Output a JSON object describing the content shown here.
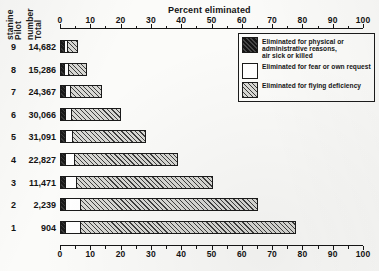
{
  "chart_data": {
    "type": "bar",
    "title": "Percent eliminated",
    "xlabel": "Percent eliminated",
    "ylabel": "Pilot stanine",
    "orientation": "horizontal",
    "stacked": true,
    "xlim": [
      0,
      100
    ],
    "xticks": [
      0,
      10,
      20,
      30,
      40,
      50,
      60,
      70,
      80,
      90,
      100
    ],
    "xtick_labels": [
      "0",
      "10",
      "20",
      "30",
      "40",
      "50",
      "60",
      "70",
      "80",
      "90",
      "100"
    ],
    "minor_tick_step": 5,
    "grid": false,
    "legend_position": "upper right",
    "categories": [
      "9",
      "8",
      "7",
      "6",
      "5",
      "4",
      "3",
      "2",
      "1"
    ],
    "row_extra_labels": [
      "14,682",
      "15,286",
      "24,367",
      "30,066",
      "31,091",
      "22,827",
      "11,471",
      "2,239",
      "904"
    ],
    "series": [
      {
        "name": "Eliminated for physical or administrative reasons, air sick or killed",
        "values": [
          1.5,
          1.6,
          1.7,
          1.6,
          1.6,
          1.6,
          1.6,
          1.7,
          1.7
        ]
      },
      {
        "name": "Eliminated for fear or own request",
        "values": [
          1.1,
          1.4,
          1.6,
          2.0,
          2.4,
          3.0,
          3.8,
          5.0,
          5.0
        ]
      },
      {
        "name": "Eliminated for flying deficiency",
        "values": [
          3.4,
          6.0,
          10.7,
          16.4,
          24.5,
          34.4,
          45.1,
          58.8,
          71.3
        ]
      }
    ],
    "totals_percent": [
      6.0,
      9.0,
      14.0,
      20.0,
      28.5,
      39.0,
      50.5,
      65.5,
      78.0
    ]
  },
  "axes": {
    "x_title": "Percent eliminated",
    "y_title_line1": "Pilot",
    "y_title_line2": "stanine",
    "y_total_line1": "Total",
    "y_total_line2": "number"
  },
  "legend": {
    "items": [
      {
        "swatch": "dark-crosshatch",
        "lines": [
          "Eliminated for physical or",
          "administrative reasons,",
          "air sick or killed"
        ]
      },
      {
        "swatch": "white-blank",
        "lines": [
          "Eliminated for fear or own request"
        ]
      },
      {
        "swatch": "diagonal-hatch",
        "lines": [
          "Eliminated for flying deficiency"
        ]
      }
    ]
  },
  "caption": {
    "text": ""
  },
  "colors": {
    "ink": "#1a1a1a",
    "paper": "#fbfbf9",
    "admin_fill": "#222222",
    "fear_fill": "#ffffff",
    "flying_fill": "#d8d8d4"
  }
}
